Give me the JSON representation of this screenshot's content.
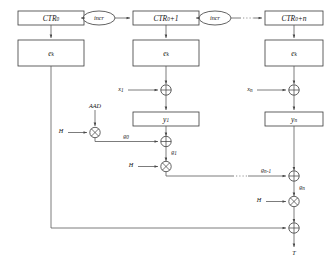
{
  "figure": {
    "background_color": "#ffffff",
    "line_color": "#5a5a5a",
    "box_stroke_color": "#3a3a3a",
    "text_color": "#111111"
  },
  "counters": [
    {
      "id": "ctr0",
      "label": "CTR",
      "sub": "0",
      "suffix": ""
    },
    {
      "id": "ctr1",
      "label": "CTR",
      "sub": "0",
      "suffix": "+1"
    },
    {
      "id": "ctrn",
      "label": "CTR",
      "sub": "0",
      "suffix": "+n"
    }
  ],
  "incr_nodes": [
    {
      "id": "incr1",
      "label": "incr"
    },
    {
      "id": "incr2",
      "label": "incr"
    }
  ],
  "cipher_blocks": [
    {
      "id": "ek0",
      "label": "e",
      "sub": "k"
    },
    {
      "id": "ek1",
      "label": "e",
      "sub": "k"
    },
    {
      "id": "ekn",
      "label": "e",
      "sub": "k"
    }
  ],
  "plaintext_inputs": [
    {
      "id": "x1",
      "label": "x",
      "sub": "1"
    },
    {
      "id": "xn",
      "label": "x",
      "sub": "n"
    }
  ],
  "ciphertext_blocks": [
    {
      "id": "y1",
      "label": "y",
      "sub": "1"
    },
    {
      "id": "yn",
      "label": "y",
      "sub": "n"
    }
  ],
  "aad_input": {
    "id": "aad",
    "label": "AAD"
  },
  "hash_keys": [
    {
      "id": "h1",
      "label": "H"
    },
    {
      "id": "h2",
      "label": "H"
    },
    {
      "id": "h3",
      "label": "H"
    }
  ],
  "ghash_values": [
    {
      "id": "g0",
      "label": "g",
      "sub": "0"
    },
    {
      "id": "g1",
      "label": "g",
      "sub": "1"
    },
    {
      "id": "gn1",
      "label": "g",
      "sub": "n-1"
    },
    {
      "id": "gn",
      "label": "g",
      "sub": "n"
    }
  ],
  "operators": {
    "xor_symbol": "xor-circle-plus",
    "mult_symbol": "mult-circle-times",
    "xor_nodes": [
      "xor-x1",
      "xor-xn",
      "xor-g0",
      "xor-gn1",
      "xor-tag"
    ],
    "mult_nodes": [
      "mult-aad",
      "mult-g1",
      "mult-gn"
    ]
  },
  "output": {
    "id": "tag",
    "label": "T"
  },
  "ellipsis": {
    "glyph": "· · ·",
    "count": 3
  }
}
